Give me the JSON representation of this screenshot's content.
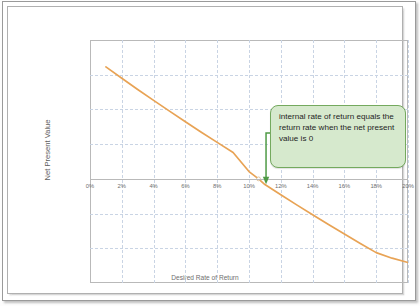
{
  "chart_data": {
    "type": "line",
    "title": "",
    "xlabel": "Desired Rate of Return",
    "ylabel": "Net Present Value",
    "xlim": [
      0,
      20
    ],
    "ylim": [
      -60000,
      80000
    ],
    "grid": true,
    "legend": "none",
    "x_tick_labels": [
      "0%",
      "2%",
      "4%",
      "6%",
      "8%",
      "10%",
      "12%",
      "14%",
      "16%",
      "18%",
      "20%"
    ],
    "x_tick_values": [
      0,
      2,
      4,
      6,
      8,
      10,
      12,
      14,
      16,
      18,
      20
    ],
    "y_tick_labels": [
      "$80,000.00",
      "$60,000.00",
      "$40,000.00",
      "$20,000.00",
      "$-",
      "$(20,000.00)",
      "$(40,000.00)",
      "$(60,000.00)"
    ],
    "y_tick_values": [
      80000,
      60000,
      40000,
      20000,
      0,
      -20000,
      -40000,
      -60000
    ],
    "series": [
      {
        "name": "Net Present Value",
        "color": "#E8A355",
        "x": [
          1.0,
          2.0,
          3.0,
          4.0,
          5.0,
          6.0,
          7.0,
          8.0,
          9.0,
          10.0,
          10.6,
          11.0,
          12.0,
          13.0,
          14.0,
          15.0,
          16.0,
          17.0,
          18.0,
          19.0,
          20.0
        ],
        "y": [
          64500,
          58000,
          51500,
          45200,
          39000,
          32900,
          26900,
          21000,
          15200,
          4200,
          0,
          -3300,
          -9200,
          -15000,
          -20700,
          -26300,
          -31800,
          -37200,
          -42500,
          -45700,
          -48200
        ]
      }
    ],
    "annotations": [
      {
        "name": "irr-callout",
        "text": "internal rate of return equals the return rate when the net present value is 0",
        "fill": "#d6e9cd",
        "border": "#74a95e",
        "points_to_x": 10.6,
        "points_to_y": 0
      }
    ],
    "marker_point": {
      "x": 10.6,
      "y": 0
    }
  },
  "callout": {
    "text": "internal rate of return equals the return rate when the net present value is 0"
  },
  "axes": {
    "y_title": "Net Present Value",
    "x_title": "Desired Rate of Return"
  }
}
